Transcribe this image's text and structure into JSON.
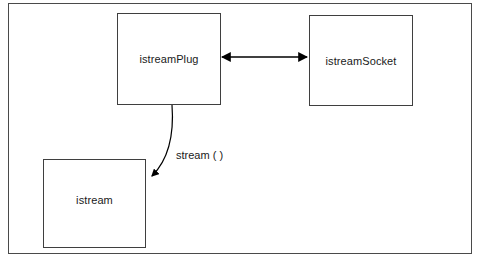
{
  "diagram": {
    "frame": {
      "border_color": "#4a4a4a"
    },
    "nodes": [
      {
        "id": "istreamPlug",
        "label": "istreamPlug",
        "shape": "rectangle",
        "border_color": "#3f3f3f",
        "fill": "#ffffff"
      },
      {
        "id": "istreamSocket",
        "label": "istreamSocket",
        "shape": "rectangle",
        "border_color": "#3f3f3f",
        "fill": "#ffffff"
      },
      {
        "id": "istream",
        "label": "istream",
        "shape": "rectangle",
        "border_color": "#3f3f3f",
        "fill": "#ffffff"
      }
    ],
    "edges": [
      {
        "id": "plug-socket",
        "from": "istreamPlug",
        "to": "istreamSocket",
        "style": "straight",
        "arrowheads": "both",
        "label": "",
        "color": "#000000"
      },
      {
        "id": "plug-stream",
        "from": "istreamPlug",
        "to": "istream",
        "style": "curved",
        "arrowheads": "end",
        "label": "stream ( )",
        "color": "#000000"
      }
    ]
  }
}
